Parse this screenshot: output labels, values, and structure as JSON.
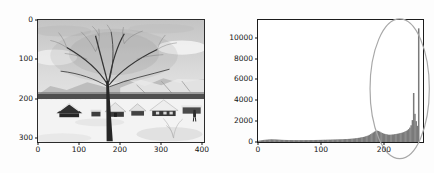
{
  "figure": {
    "background": "#ffffff",
    "axis_color": "#141414"
  },
  "chart_data": [
    {
      "type": "image",
      "panel": "left",
      "content": "grayscale-winter-village-photo",
      "content_elements": [
        "cloudy-sky",
        "snowy-mountains",
        "dark-treeline",
        "large-bare-tree",
        "snow-covered-houses",
        "snow-ground",
        "person-figure",
        "shrub"
      ],
      "xlim": [
        0,
        405
      ],
      "ylim": [
        0,
        310
      ],
      "y_direction": "down",
      "x_tick_values": [
        0,
        100,
        200,
        300,
        400
      ],
      "x_tick_labels": [
        "0",
        "100",
        "200",
        "300",
        "400"
      ],
      "y_tick_values": [
        0,
        100,
        200,
        300
      ],
      "y_tick_labels": [
        "0",
        "100",
        "200",
        "300"
      ],
      "grid": false,
      "title": ""
    },
    {
      "type": "bar",
      "panel": "right",
      "subtype": "histogram",
      "title": "",
      "xlabel": "",
      "ylabel": "",
      "grid": false,
      "bar_color": "#7a7a7a",
      "xlim": [
        0,
        262
      ],
      "ylim": [
        0,
        11700
      ],
      "x_tick_values": [
        0,
        100,
        200
      ],
      "x_tick_labels": [
        "0",
        "100",
        "200"
      ],
      "y_tick_values": [
        0,
        2000,
        4000,
        6000,
        8000,
        10000
      ],
      "y_tick_labels": [
        "0",
        "2000",
        "4000",
        "6000",
        "8000",
        "10000"
      ],
      "bin_start": 0,
      "bin_width": 2,
      "values": [
        120,
        140,
        160,
        180,
        200,
        210,
        220,
        230,
        240,
        250,
        258,
        254,
        250,
        245,
        240,
        232,
        224,
        216,
        210,
        205,
        200,
        197,
        194,
        191,
        189,
        187,
        185,
        184,
        183,
        182,
        181,
        180,
        180,
        180,
        180,
        181,
        182,
        183,
        184,
        185,
        186,
        187,
        188,
        190,
        192,
        194,
        196,
        198,
        200,
        203,
        206,
        209,
        212,
        215,
        218,
        221,
        224,
        228,
        232,
        236,
        240,
        244,
        248,
        252,
        256,
        260,
        265,
        270,
        276,
        282,
        288,
        295,
        302,
        310,
        320,
        332,
        345,
        360,
        376,
        394,
        412,
        432,
        455,
        480,
        510,
        545,
        585,
        630,
        690,
        760,
        840,
        920,
        1000,
        1060,
        1090,
        1060,
        1000,
        930,
        870,
        820,
        780,
        750,
        725,
        705,
        695,
        700,
        715,
        730,
        750,
        770,
        790,
        815,
        840,
        870,
        905,
        945,
        995,
        1055,
        1130,
        1230,
        1380,
        1600,
        2100,
        4700,
        2700,
        2000,
        1550,
        10900
      ],
      "annotation": {
        "shape": "ellipse",
        "x": 225,
        "y": 5100,
        "rx": 47,
        "ry": 6700,
        "color": "#a8a8a8",
        "stroke_width": 1.2
      }
    }
  ]
}
